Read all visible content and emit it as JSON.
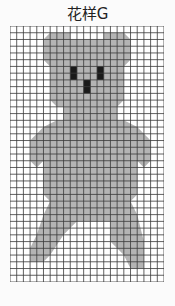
{
  "title": "花样G",
  "grid": {
    "cols": 23,
    "rows": 38,
    "cell_w": 6.7,
    "cell_h": 6.74
  },
  "colors": {
    "fill": "#b4b4b4",
    "line": "#3a3a3a",
    "feature": "#1a1a1a",
    "bg": "#ffffff"
  },
  "shape": {
    "description": "teddy bear silhouette (knitting chart)",
    "features": [
      "left-eye",
      "right-eye",
      "nose"
    ]
  }
}
